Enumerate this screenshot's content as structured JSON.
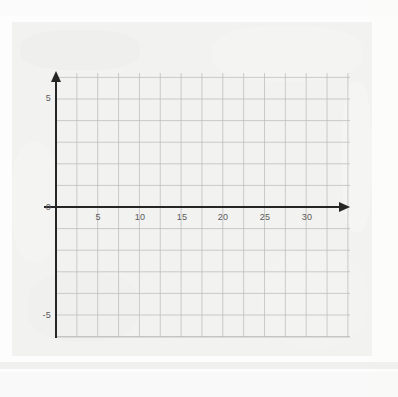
{
  "page": {
    "background_color": "#fdfdfd",
    "card_background_color": "#f2f2f1"
  },
  "graph": {
    "name": "coordinate-grid-blank",
    "axis_color": "#262626",
    "grid_color": "#b9b9b9",
    "grid_minor_color": "#d6d6d6",
    "label_color": "#5a5a5a",
    "origin_label": "0",
    "x_axis": {
      "label": "",
      "tick_labels": [
        "5",
        "10",
        "15",
        "20",
        "25",
        "30"
      ],
      "tick_values": [
        5,
        10,
        15,
        20,
        25,
        30
      ],
      "min": -1.25,
      "max": 34,
      "arrow": "right-arrowhead"
    },
    "y_axis": {
      "label": "",
      "tick_labels": [
        "5",
        "-5"
      ],
      "tick_values": [
        5,
        -5
      ],
      "min": -6.2,
      "max": 6.2,
      "arrow": "up-arrowhead"
    }
  },
  "chart_data": {
    "type": "scatter",
    "title": "",
    "subtitle": "",
    "xlabel": "",
    "ylabel": "",
    "x": [],
    "y": [],
    "series": [],
    "annotations": [],
    "xlim": [
      -1.25,
      34
    ],
    "ylim": [
      -6.2,
      6.2
    ],
    "xticks": [
      5,
      10,
      15,
      20,
      25,
      30
    ],
    "yticks": [
      5,
      0,
      -5
    ],
    "xtick_labels": [
      "5",
      "10",
      "15",
      "20",
      "25",
      "30"
    ],
    "ytick_labels": [
      "5",
      "0",
      "-5"
    ],
    "grid": true,
    "grid_step_x": 2.5,
    "grid_step_y": 1,
    "legend": null,
    "legend_position": "none",
    "note": "Empty coordinate grid with no plotted data"
  }
}
